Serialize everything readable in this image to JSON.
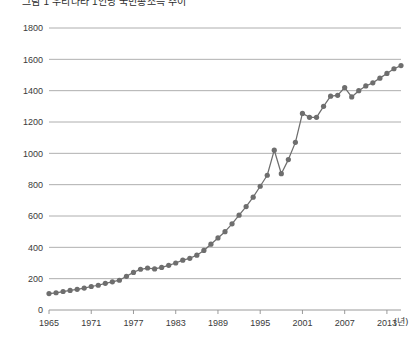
{
  "chart_data": {
    "type": "line",
    "title": "그림 1 우리나라 1인당 국민총소득 추이",
    "xlabel": "(년)",
    "ylabel": "",
    "ylim": [
      0,
      1800
    ],
    "xlim": [
      1965,
      2015
    ],
    "grid": true,
    "legend": null,
    "marker": "circle",
    "series_color": "#6e6e6e",
    "y_ticks": [
      0,
      200,
      400,
      600,
      800,
      1000,
      1200,
      1400,
      1600,
      1800
    ],
    "x_ticks": [
      1965,
      1971,
      1977,
      1983,
      1989,
      1995,
      2001,
      2007,
      2013
    ],
    "x": [
      1965,
      1966,
      1967,
      1968,
      1969,
      1970,
      1971,
      1972,
      1973,
      1974,
      1975,
      1976,
      1977,
      1978,
      1979,
      1980,
      1981,
      1982,
      1983,
      1984,
      1985,
      1986,
      1987,
      1988,
      1989,
      1990,
      1991,
      1992,
      1993,
      1994,
      1995,
      1996,
      1997,
      1998,
      1999,
      2000,
      2001,
      2002,
      2003,
      2004,
      2005,
      2006,
      2007,
      2008,
      2009,
      2010,
      2011,
      2012,
      2013,
      2014,
      2015
    ],
    "values": [
      105,
      110,
      118,
      125,
      132,
      140,
      150,
      158,
      170,
      180,
      190,
      215,
      240,
      260,
      268,
      262,
      272,
      285,
      300,
      318,
      330,
      350,
      380,
      420,
      460,
      500,
      550,
      605,
      660,
      720,
      790,
      860,
      1020,
      870,
      960,
      1070,
      1255,
      1230,
      1230,
      1300,
      1365,
      1370,
      1420,
      1360,
      1400,
      1430,
      1450,
      1480,
      1510,
      1540,
      1560
    ],
    "annotations": {
      "crisis_dip_year": 1998,
      "crisis_dip_value": 870,
      "peak_1997_value": 1020,
      "plateau_2008_value": 1360,
      "final_value": 1560
    }
  }
}
